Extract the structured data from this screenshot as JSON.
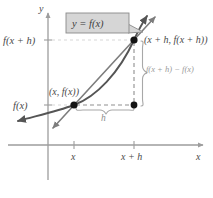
{
  "figure": {
    "kind": "difference-quotient-secant-diagram",
    "background_color": "#ffffff"
  },
  "callout": {
    "label": "y = f(x)",
    "fill_color": "#d6d6d6",
    "border_color": "#8a8a8a"
  },
  "axes": {
    "y_axis_label": "y",
    "x_axis_label": "x",
    "axis_color": "#9d9d9d",
    "origin_px": [
      48,
      145
    ],
    "x_ticks": [
      {
        "label": "x",
        "x_px": 74
      },
      {
        "label": "x + h",
        "x_px": 134
      }
    ],
    "y_ticks": [
      {
        "label": "f(x + h)",
        "y_px": 40
      },
      {
        "label": "f(x)",
        "y_px": 105
      }
    ]
  },
  "points": [
    {
      "name": "point-lower",
      "label": "(x, f(x))",
      "x_px": 74,
      "y_px": 105,
      "color": "#1a1a1a"
    },
    {
      "name": "point-upper",
      "label": "(x + h, f(x + h))",
      "x_px": 134,
      "y_px": 40,
      "color": "#1a1a1a"
    },
    {
      "name": "point-corner",
      "label": "",
      "x_px": 134,
      "y_px": 105,
      "color": "#1a1a1a"
    }
  ],
  "annotations": {
    "rise_label": "f(x + h) − f(x)",
    "run_label": "h",
    "brace_color": "#a8a8a8",
    "dashed_color": "#8f8f8f"
  },
  "curve": {
    "name": "function-curve",
    "color": "#555555",
    "description": "increasing concave-up curve y = f(x)"
  },
  "secant": {
    "name": "secant-line",
    "color": "#7d7d7d",
    "description": "secant line through (x, f(x)) and (x + h, f(x + h))"
  },
  "colors": {
    "ink": "#4a4a4a",
    "light_gray": "#9a9a9a",
    "dark": "#1a1a1a"
  }
}
